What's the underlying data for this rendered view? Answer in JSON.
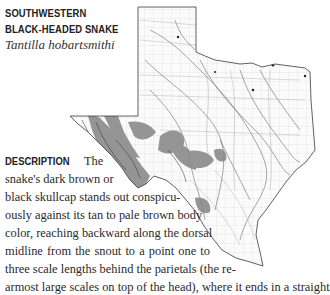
{
  "species": {
    "common_name_line1": "SOUTHWESTERN",
    "common_name_line2": "BLACK-HEADED SNAKE",
    "scientific_name": "Tantilla hobartsmithi"
  },
  "map": {
    "region": "Texas",
    "range_color": "#8a8a8a",
    "outline_color": "#333333"
  },
  "description": {
    "heading": "DESCRIPTION",
    "lines": [
      "The",
      "snake's dark brown or",
      "black skullcap stands out conspicu-",
      "ously against its tan to pale brown body",
      "color, reaching backward along the dorsal",
      "midline from the snout to a point one to",
      "three scale lengths behind the parietals (the re-",
      "armost large scales on top of the head), where it ends in a straight"
    ]
  }
}
